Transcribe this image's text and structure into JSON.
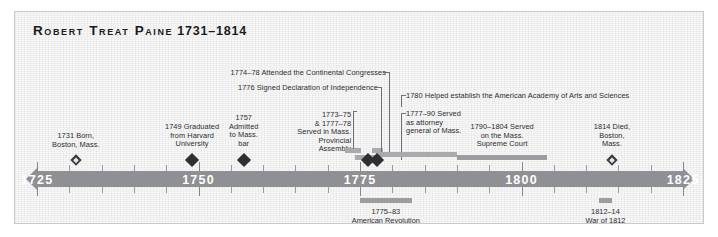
{
  "title": {
    "name": "Robert Treat Paine",
    "years": "1731–1814"
  },
  "axis": {
    "start_year": 1725,
    "end_year": 1825,
    "labels": [
      "1725",
      "1750",
      "1775",
      "1800",
      "1825"
    ],
    "minor_tick_interval": 5,
    "bar_color": "#8f9093",
    "label_color": "#ffffff"
  },
  "events": [
    {
      "id": "born",
      "text": "1731 Born,\nBoston, Mass.",
      "year": 1731,
      "marker": "open-diamond",
      "align": "center"
    },
    {
      "id": "harvard",
      "text": "1749 Graduated\nfrom Harvard\nUniversity",
      "year": 1749,
      "marker": "diamond",
      "align": "center"
    },
    {
      "id": "bar-admission",
      "text": "1757\nAdmitted\nto Mass.\nbar",
      "year": 1757,
      "marker": "diamond",
      "align": "center"
    },
    {
      "id": "provincial-assembly",
      "text": "1773–75\n& 1777–78\nServed in Mass.\nProvincial\nAssembly",
      "year_start": 1773,
      "year_end": 1778,
      "marker": "span",
      "align": "right"
    },
    {
      "id": "continental-congresses",
      "text": "1774–78 Attended the Continental Congresses",
      "year_start": 1774,
      "year_end": 1778,
      "marker": "leader",
      "align": "right"
    },
    {
      "id": "declaration",
      "text": "1776 Signed Declaration of Independence",
      "year": 1776,
      "marker": "diamond",
      "align": "right"
    },
    {
      "id": "attorney-general",
      "text": "1777–90 Served\nas attorney\ngeneral of Mass.",
      "year_start": 1777,
      "year_end": 1790,
      "marker": "span",
      "align": "left"
    },
    {
      "id": "academy",
      "text": "1780 Helped establish the American Academy of Arts and Sciences",
      "year": 1780,
      "marker": "leader",
      "align": "left"
    },
    {
      "id": "supreme-court",
      "text": "1790–1804 Served\non the Mass.\nSupreme Court",
      "year_start": 1790,
      "year_end": 1804,
      "marker": "span",
      "align": "center"
    },
    {
      "id": "died",
      "text": "1814 Died,\nBoston,\nMass.",
      "year": 1814,
      "marker": "open-diamond",
      "align": "center"
    }
  ],
  "eras": [
    {
      "id": "american-revolution",
      "text": "1775–83\nAmerican Revolution",
      "year_start": 1775,
      "year_end": 1783
    },
    {
      "id": "war-of-1812",
      "text": "1812–14\nWar of 1812",
      "year_start": 1812,
      "year_end": 1814
    }
  ]
}
